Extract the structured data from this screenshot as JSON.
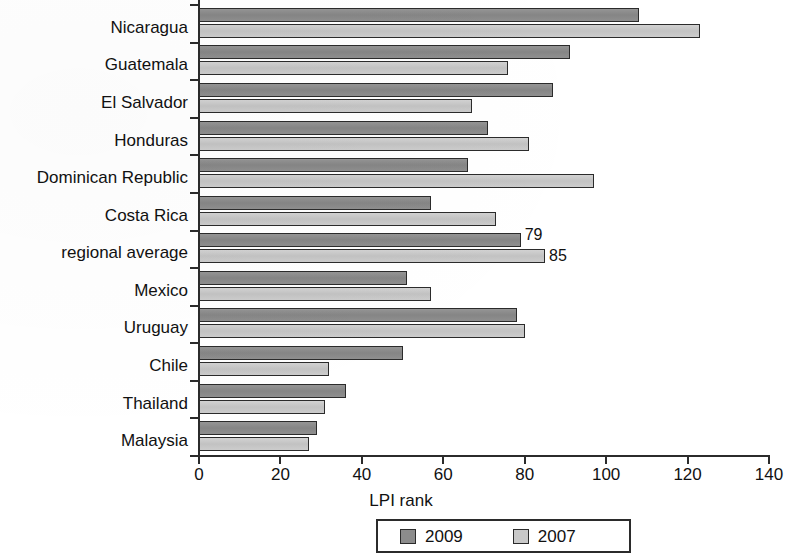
{
  "chart_data": {
    "type": "bar",
    "orientation": "horizontal",
    "title": "",
    "xlabel": "LPI rank",
    "ylabel": "",
    "xlim": [
      0,
      140
    ],
    "xticks": [
      0,
      20,
      40,
      60,
      80,
      100,
      120,
      140
    ],
    "grid": false,
    "legend_position": "bottom-center",
    "categories": [
      "Nicaragua",
      "Guatemala",
      "El Salvador",
      "Honduras",
      "Dominican Republic",
      "Costa Rica",
      "regional average",
      "Mexico",
      "Uruguay",
      "Chile",
      "Thailand",
      "Malaysia"
    ],
    "series": [
      {
        "name": "2009",
        "color": "#8c8c8c",
        "values": [
          108,
          91,
          87,
          71,
          66,
          57,
          79,
          51,
          78,
          50,
          36,
          29
        ]
      },
      {
        "name": "2007",
        "color": "#c9c9c9",
        "values": [
          123,
          76,
          67,
          81,
          97,
          73,
          85,
          57,
          80,
          32,
          31,
          27
        ]
      }
    ],
    "annotations": [
      {
        "category": "regional average",
        "series": "2009",
        "text": "79"
      },
      {
        "category": "regional average",
        "series": "2007",
        "text": "85"
      }
    ]
  },
  "axis": {
    "x_title": "LPI rank",
    "tick_labels": [
      "0",
      "20",
      "40",
      "60",
      "80",
      "100",
      "120",
      "140"
    ]
  },
  "legend": {
    "items": [
      {
        "label": "2009",
        "color": "#8c8c8c"
      },
      {
        "label": "2007",
        "color": "#c9c9c9"
      }
    ]
  },
  "labels": {
    "c0": "Nicaragua",
    "c1": "Guatemala",
    "c2": "El Salvador",
    "c3": "Honduras",
    "c4": "Dominican Republic",
    "c5": "Costa Rica",
    "c6": "regional average",
    "c7": "Mexico",
    "c8": "Uruguay",
    "c9": "Chile",
    "c10": "Thailand",
    "c11": "Malaysia"
  },
  "value_labels": {
    "regional_average_2009": "79",
    "regional_average_2007": "85"
  }
}
